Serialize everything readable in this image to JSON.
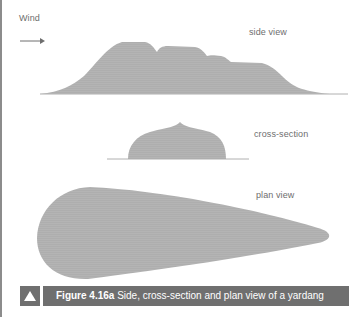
{
  "labels": {
    "wind": "Wind",
    "side_view": "side view",
    "cross_section": "cross-section",
    "plan_view": "plan view"
  },
  "caption": {
    "figure_number": "Figure 4.16a",
    "text": " Side, cross-section and plan view of a yardang",
    "icon": "triangle-up-icon"
  },
  "colors": {
    "shape_fill": "#b3b3b3",
    "baseline": "#b0b0b0",
    "caption_bg": "#6f6f6f",
    "caption_text": "#ffffff",
    "label_text": "#6e6e6e"
  }
}
